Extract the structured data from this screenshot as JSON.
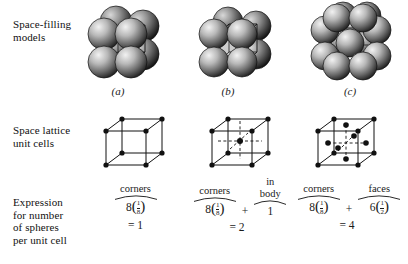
{
  "figure": {
    "background": "#ffffff",
    "ink": "#1a1a1a"
  },
  "rows": {
    "space_filling_label": "Space-filling\nmodels",
    "lattice_label": "Space lattice\nunit cells",
    "expression_label": "Expression\nfor number\nof spheres\nper unit cell"
  },
  "columns": [
    {
      "caption": "(a)",
      "structure": "simple-cubic",
      "spheres_drawn": 8,
      "lattice_points": {
        "corners": 8,
        "body_center": 0,
        "face_centers": 0
      },
      "terms": [
        {
          "head": "corners",
          "coefficient": "8",
          "fraction_num": "1",
          "fraction_den": "8"
        }
      ],
      "total": "= 1"
    },
    {
      "caption": "(b)",
      "structure": "body-centered-cubic",
      "spheres_drawn": 9,
      "lattice_points": {
        "corners": 8,
        "body_center": 1,
        "face_centers": 0
      },
      "terms": [
        {
          "head": "corners",
          "coefficient": "8",
          "fraction_num": "1",
          "fraction_den": "8"
        },
        {
          "operator": "+",
          "head": "in\nbody",
          "coefficient": "1",
          "fraction_num": "",
          "fraction_den": ""
        }
      ],
      "total": "= 2"
    },
    {
      "caption": "(c)",
      "structure": "face-centered-cubic",
      "spheres_drawn": 14,
      "lattice_points": {
        "corners": 8,
        "body_center": 0,
        "face_centers": 6
      },
      "terms": [
        {
          "head": "corners",
          "coefficient": "8",
          "fraction_num": "1",
          "fraction_den": "8"
        },
        {
          "operator": "+",
          "head": "faces",
          "coefficient": "6",
          "fraction_num": "1",
          "fraction_den": "2"
        }
      ],
      "total": "= 4"
    }
  ]
}
